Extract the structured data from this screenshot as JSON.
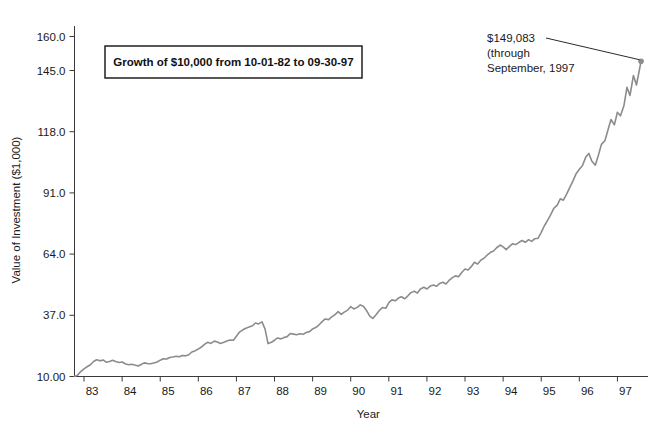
{
  "chart_data": {
    "type": "line",
    "title": "Growth of $10,000 from 10-01-82 to 09-30-97",
    "xlabel": "Year",
    "ylabel": "Value of Investment ($1,000)",
    "xlim": [
      1982.75,
      1997.75
    ],
    "ylim": [
      10.0,
      160.0
    ],
    "grid": false,
    "legend": null,
    "x_tick_labels": [
      "83",
      "84",
      "85",
      "86",
      "87",
      "88",
      "89",
      "90",
      "91",
      "92",
      "93",
      "94",
      "95",
      "96",
      "97"
    ],
    "x_tick_values": [
      1983,
      1984,
      1985,
      1986,
      1987,
      1988,
      1989,
      1990,
      1991,
      1992,
      1993,
      1994,
      1995,
      1996,
      1997
    ],
    "y_tick_labels": [
      "10.00",
      "37.0",
      "64.0",
      "91.0",
      "118.0",
      "145.0",
      "160.0"
    ],
    "y_tick_values": [
      10.0,
      37.0,
      64.0,
      91.0,
      118.0,
      145.0,
      160.0
    ],
    "line_color": "#8c8c8c",
    "marker_color": "#8c8c8c",
    "annotations": [
      {
        "name": "final-value-annotation",
        "lines": [
          "$149,083",
          "(through",
          "September, 1997"
        ],
        "points_to_x": 1997.62,
        "points_to_y": 149.083
      }
    ],
    "series": [
      {
        "name": "Value of Investment",
        "x": [
          1982.75,
          1982.83,
          1982.92,
          1983.0,
          1983.08,
          1983.17,
          1983.25,
          1983.33,
          1983.42,
          1983.5,
          1983.58,
          1983.67,
          1983.75,
          1983.83,
          1983.92,
          1984.0,
          1984.08,
          1984.17,
          1984.25,
          1984.33,
          1984.42,
          1984.5,
          1984.58,
          1984.67,
          1984.75,
          1984.83,
          1984.92,
          1985.0,
          1985.08,
          1985.17,
          1985.25,
          1985.33,
          1985.42,
          1985.5,
          1985.58,
          1985.67,
          1985.75,
          1985.83,
          1985.92,
          1986.0,
          1986.08,
          1986.17,
          1986.25,
          1986.33,
          1986.42,
          1986.5,
          1986.58,
          1986.67,
          1986.75,
          1986.83,
          1986.92,
          1987.0,
          1987.08,
          1987.17,
          1987.25,
          1987.33,
          1987.42,
          1987.5,
          1987.58,
          1987.67,
          1987.75,
          1987.83,
          1987.92,
          1988.0,
          1988.08,
          1988.17,
          1988.25,
          1988.33,
          1988.42,
          1988.5,
          1988.58,
          1988.67,
          1988.75,
          1988.83,
          1988.92,
          1989.0,
          1989.08,
          1989.17,
          1989.25,
          1989.33,
          1989.42,
          1989.5,
          1989.58,
          1989.67,
          1989.75,
          1989.83,
          1989.92,
          1990.0,
          1990.08,
          1990.17,
          1990.25,
          1990.33,
          1990.42,
          1990.5,
          1990.58,
          1990.67,
          1990.75,
          1990.83,
          1990.92,
          1991.0,
          1991.08,
          1991.17,
          1991.25,
          1991.33,
          1991.42,
          1991.5,
          1991.58,
          1991.67,
          1991.75,
          1991.83,
          1991.92,
          1992.0,
          1992.08,
          1992.17,
          1992.25,
          1992.33,
          1992.42,
          1992.5,
          1992.58,
          1992.67,
          1992.75,
          1992.83,
          1992.92,
          1993.0,
          1993.08,
          1993.17,
          1993.25,
          1993.33,
          1993.42,
          1993.5,
          1993.58,
          1993.67,
          1993.75,
          1993.83,
          1993.92,
          1994.0,
          1994.08,
          1994.17,
          1994.25,
          1994.33,
          1994.42,
          1994.5,
          1994.58,
          1994.67,
          1994.75,
          1994.83,
          1994.92,
          1995.0,
          1995.08,
          1995.17,
          1995.25,
          1995.33,
          1995.42,
          1995.5,
          1995.58,
          1995.67,
          1995.75,
          1995.83,
          1995.92,
          1996.0,
          1996.08,
          1996.17,
          1996.25,
          1996.33,
          1996.42,
          1996.5,
          1996.58,
          1996.67,
          1996.75,
          1996.83,
          1996.92,
          1997.0,
          1997.08,
          1997.17,
          1997.25,
          1997.33,
          1997.42,
          1997.5,
          1997.62
        ],
        "y": [
          10.0,
          10.6,
          12.3,
          13.4,
          14.3,
          15.2,
          16.6,
          17.4,
          16.9,
          17.3,
          16.3,
          16.6,
          17.2,
          16.6,
          16.2,
          16.4,
          15.6,
          15.2,
          15.4,
          15.1,
          14.6,
          15.3,
          16.0,
          15.7,
          15.6,
          16.0,
          16.4,
          17.2,
          17.8,
          17.7,
          18.4,
          18.6,
          18.9,
          18.7,
          19.3,
          19.1,
          19.6,
          20.8,
          21.4,
          22.1,
          23.0,
          24.3,
          25.1,
          24.6,
          25.6,
          25.2,
          24.6,
          25.1,
          25.7,
          26.1,
          26.0,
          27.8,
          29.6,
          30.6,
          31.3,
          31.8,
          32.4,
          33.6,
          33.2,
          34.1,
          31.0,
          24.5,
          25.1,
          26.0,
          27.0,
          26.6,
          27.2,
          27.6,
          29.0,
          28.7,
          28.4,
          28.9,
          28.6,
          29.4,
          29.8,
          31.0,
          31.6,
          32.8,
          34.2,
          35.4,
          35.1,
          36.3,
          37.2,
          38.6,
          37.4,
          38.4,
          39.3,
          40.8,
          39.8,
          40.5,
          41.6,
          41.0,
          39.0,
          36.6,
          35.6,
          37.4,
          39.1,
          40.4,
          40.1,
          42.6,
          43.8,
          43.4,
          44.6,
          45.2,
          44.3,
          45.6,
          47.0,
          47.6,
          46.8,
          48.6,
          49.4,
          48.6,
          49.8,
          50.4,
          49.8,
          51.0,
          51.6,
          50.8,
          52.4,
          53.6,
          54.4,
          54.0,
          56.0,
          57.4,
          57.0,
          58.6,
          60.4,
          59.6,
          61.4,
          62.2,
          63.6,
          64.8,
          65.4,
          66.8,
          68.0,
          67.2,
          66.0,
          67.4,
          68.6,
          68.2,
          69.2,
          70.0,
          69.2,
          70.4,
          69.6,
          70.8,
          71.0,
          73.6,
          76.4,
          79.0,
          81.4,
          84.2,
          85.6,
          88.4,
          87.8,
          90.6,
          93.4,
          96.2,
          99.6,
          101.4,
          103.0,
          106.8,
          108.4,
          105.0,
          103.2,
          107.6,
          112.4,
          114.0,
          118.6,
          123.4,
          121.0,
          126.6,
          125.0,
          129.4,
          137.6,
          134.0,
          142.8,
          138.6,
          149.083
        ]
      }
    ]
  },
  "title_box": {
    "text": "Growth of $10,000 from 10-01-82 to 09-30-97"
  },
  "axes": {
    "y_title": "Value of Investment ($1,000)",
    "x_title": "Year"
  },
  "annotation": {
    "line1": "$149,083",
    "line2": "(through",
    "line3": "September, 1997"
  }
}
